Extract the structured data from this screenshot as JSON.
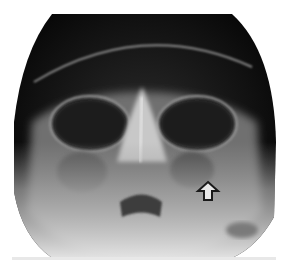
{
  "image": {
    "subject": "skull radiograph (occipitomental / Waters view)",
    "background_color": "#ffffff",
    "film_dark": "#0c0c0c",
    "bone_light": "#d8d8d8"
  },
  "annotations": [
    {
      "type": "open-arrow",
      "direction": "up",
      "x": 196,
      "y": 183,
      "color": "#1a1a1a"
    }
  ]
}
